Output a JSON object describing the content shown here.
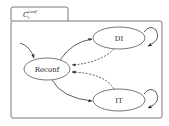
{
  "diagram": {
    "container": {
      "tab_label_base": "C",
      "tab_label_sub": "i",
      "tab_label_sup": "conf"
    },
    "states": [
      {
        "id": "reconf",
        "label": "Reconf"
      },
      {
        "id": "di",
        "label": "DI"
      },
      {
        "id": "it",
        "label": "IT"
      }
    ],
    "transitions": [
      {
        "from": "initial",
        "to": "reconf",
        "style": "solid"
      },
      {
        "from": "reconf",
        "to": "di",
        "style": "solid"
      },
      {
        "from": "reconf",
        "to": "it",
        "style": "solid"
      },
      {
        "from": "di",
        "to": "reconf",
        "style": "dashed"
      },
      {
        "from": "it",
        "to": "reconf",
        "style": "dashed"
      },
      {
        "from": "di",
        "to": "di",
        "style": "solid"
      },
      {
        "from": "it",
        "to": "it",
        "style": "solid"
      }
    ],
    "colors": {
      "stroke": "#444444",
      "background": "#ffffff",
      "text": "#222222"
    }
  }
}
